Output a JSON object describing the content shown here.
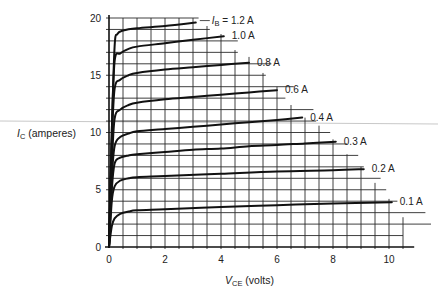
{
  "chart_data": {
    "type": "line",
    "title": "",
    "xlabel": "V_CE (volts)",
    "ylabel": "I_C (amperes)",
    "xlim": [
      0,
      11
    ],
    "ylim": [
      0,
      20
    ],
    "x_ticks": [
      0,
      2,
      4,
      6,
      8,
      10
    ],
    "y_ticks": [
      0,
      5,
      10,
      15,
      20
    ],
    "grid": true,
    "grid_spacing": {
      "x": 0.5,
      "y": 1
    },
    "legend_position": "inline labels at curve ends",
    "series": [
      {
        "name": "I_B = 1.2 A",
        "label": "I_B = 1.2 A",
        "x": [
          0,
          0.1,
          0.2,
          0.3,
          0.5,
          1.0,
          2.0,
          3.1
        ],
        "y": [
          0,
          10,
          17.5,
          18.6,
          18.9,
          19.1,
          19.3,
          19.6
        ]
      },
      {
        "name": "1.0 A",
        "label": "1.0 A",
        "x": [
          0,
          0.1,
          0.2,
          0.4,
          0.7,
          1.0,
          2.0,
          3.0,
          4.1
        ],
        "y": [
          0,
          10,
          16.2,
          16.9,
          17.3,
          17.5,
          17.8,
          18.1,
          18.4
        ]
      },
      {
        "name": "0.8 A",
        "label": "0.8 A",
        "x": [
          0,
          0.1,
          0.2,
          0.4,
          0.7,
          1.0,
          2.0,
          3.0,
          4.0,
          5.0
        ],
        "y": [
          0,
          9,
          13.8,
          14.6,
          15.0,
          15.2,
          15.5,
          15.7,
          15.9,
          16.1
        ]
      },
      {
        "name": "0.6 A",
        "label": "0.6 A",
        "x": [
          0,
          0.1,
          0.2,
          0.4,
          0.7,
          1.0,
          2.0,
          3.0,
          4.0,
          5.0,
          6.0
        ],
        "y": [
          0,
          7,
          11.2,
          12.0,
          12.4,
          12.6,
          12.9,
          13.1,
          13.3,
          13.5,
          13.7
        ]
      },
      {
        "name": "0.4 A",
        "label": "0.4 A",
        "x": [
          0,
          0.1,
          0.2,
          0.4,
          0.7,
          1.0,
          2.0,
          3.0,
          4.0,
          5.0,
          6.0,
          6.9
        ],
        "y": [
          0,
          6,
          8.8,
          9.6,
          9.9,
          10.1,
          10.3,
          10.5,
          10.7,
          10.9,
          11.1,
          11.3
        ]
      },
      {
        "name": "0.3 A",
        "label": "0.3 A",
        "x": [
          0,
          0.1,
          0.2,
          0.4,
          0.7,
          1.0,
          2.0,
          3.0,
          4.0,
          5.0,
          6.0,
          7.0,
          8.1
        ],
        "y": [
          0,
          5,
          7.3,
          7.8,
          8.0,
          8.1,
          8.3,
          8.5,
          8.6,
          8.8,
          8.9,
          9.05,
          9.2
        ]
      },
      {
        "name": "0.2 A",
        "label": "0.2 A",
        "x": [
          0,
          0.1,
          0.2,
          0.4,
          0.7,
          1.0,
          2.0,
          4.0,
          6.0,
          8.0,
          9.1
        ],
        "y": [
          0,
          4,
          5.3,
          5.8,
          6.0,
          6.1,
          6.2,
          6.4,
          6.6,
          6.7,
          6.8
        ]
      },
      {
        "name": "0.1 A",
        "label": "0.1 A",
        "x": [
          0,
          0.1,
          0.2,
          0.4,
          0.7,
          1.0,
          2.0,
          4.0,
          6.0,
          8.0,
          10.1
        ],
        "y": [
          0,
          1.8,
          2.5,
          2.9,
          3.1,
          3.2,
          3.3,
          3.5,
          3.65,
          3.8,
          3.9
        ]
      }
    ]
  },
  "labels": {
    "y_axis_italic": "I",
    "y_axis_sub": "C",
    "y_axis_rest": " (amperes)",
    "x_axis_italic": "V",
    "x_axis_sub": "CE",
    "x_axis_rest": " (volts)",
    "ib_prefix_italic": "I",
    "ib_prefix_sub": "B",
    "ib_first": " = 1.2 A"
  },
  "colors": {
    "curve": "#111111",
    "grid": "#2a2a2a",
    "artifact_line": "#c8c8c8"
  }
}
